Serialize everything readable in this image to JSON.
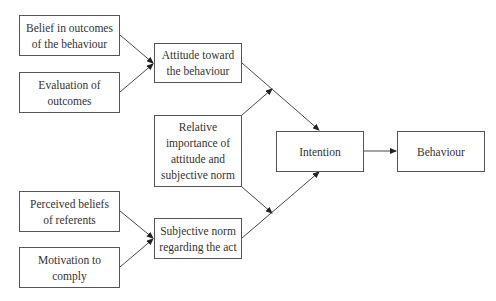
{
  "diagram": {
    "nodes": [
      {
        "id": "belief",
        "lines": [
          "Belief in outcomes",
          "of the behaviour"
        ],
        "x": 19,
        "y": 15,
        "w": 101,
        "h": 41
      },
      {
        "id": "evaluation",
        "lines": [
          "Evaluation of",
          "outcomes"
        ],
        "x": 19,
        "y": 72,
        "w": 101,
        "h": 41
      },
      {
        "id": "attitude",
        "lines": [
          "Attitude toward",
          "the behaviour"
        ],
        "x": 154,
        "y": 43,
        "w": 88,
        "h": 40
      },
      {
        "id": "relative",
        "lines": [
          "Relative",
          "importance of",
          "attitude and",
          "subjective norm"
        ],
        "x": 154,
        "y": 115,
        "w": 88,
        "h": 72
      },
      {
        "id": "perceived",
        "lines": [
          "Perceived beliefs",
          "of referents"
        ],
        "x": 19,
        "y": 191,
        "w": 101,
        "h": 41
      },
      {
        "id": "motivation",
        "lines": [
          "Motivation to",
          "comply"
        ],
        "x": 19,
        "y": 247,
        "w": 101,
        "h": 41
      },
      {
        "id": "subjective",
        "lines": [
          "Subjective norm",
          "regarding the act"
        ],
        "x": 154,
        "y": 218,
        "w": 88,
        "h": 41
      },
      {
        "id": "intention",
        "lines": [
          "Intention"
        ],
        "x": 276,
        "y": 131,
        "w": 88,
        "h": 41
      },
      {
        "id": "behaviour",
        "lines": [
          "Behaviour"
        ],
        "x": 397,
        "y": 131,
        "w": 88,
        "h": 41
      }
    ],
    "edges": [
      {
        "from": "belief",
        "to": "attitude"
      },
      {
        "from": "evaluation",
        "to": "attitude"
      },
      {
        "from": "attitude",
        "to": "intention"
      },
      {
        "from": "relative",
        "to": "attitude-intention-link"
      },
      {
        "from": "relative",
        "to": "subjective-intention-link"
      },
      {
        "from": "perceived",
        "to": "subjective"
      },
      {
        "from": "motivation",
        "to": "subjective"
      },
      {
        "from": "subjective",
        "to": "intention"
      },
      {
        "from": "intention",
        "to": "behaviour"
      }
    ],
    "colors": {
      "line": "#333333",
      "border": "#555555",
      "text": "#333333"
    }
  }
}
